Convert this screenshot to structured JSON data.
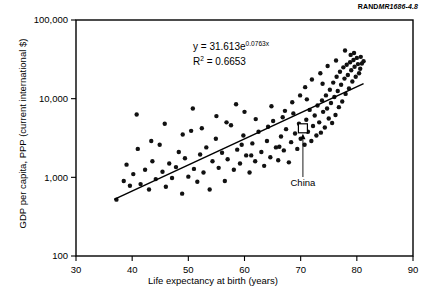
{
  "figure": {
    "source_prefix": "RAND",
    "source_id": "MR1686-4.8"
  },
  "chart_data": {
    "type": "scatter",
    "title": "",
    "xlabel": "Life expectancy at birth (years)",
    "ylabel": "GDP per capita, PPP (current international $)",
    "xlim": [
      30,
      90
    ],
    "ylim": [
      100,
      100000
    ],
    "yscale": "log",
    "xscale": "linear",
    "grid": false,
    "legend": "none",
    "xticks": [
      30,
      40,
      50,
      60,
      70,
      80,
      90
    ],
    "xtick_labels": [
      "30",
      "40",
      "50",
      "60",
      "70",
      "80",
      "90"
    ],
    "yticks": [
      100,
      1000,
      10000,
      100000
    ],
    "ytick_labels": [
      "100",
      "1,000",
      "10,000",
      "100,000"
    ],
    "annotations": [
      {
        "name": "regression-equation",
        "line1_prefix": "y = 31.613e",
        "line1_exponent": "0.0763x",
        "line2_prefix": "R",
        "line2_superscript": "2",
        "line2_suffix": " = 0.6653",
        "x": 59,
        "y": 38000
      },
      {
        "name": "china-callout",
        "label": "China",
        "point_x": 70.4,
        "point_y": 4200,
        "marker": "open-square"
      }
    ],
    "trendline": {
      "equation": "y = 31.613*exp(0.0763*x)",
      "coefficient": 31.613,
      "exponent": 0.0763,
      "r_squared": 0.6653,
      "x_start": 36.8,
      "x_end": 81.2
    },
    "points": [
      [
        37.2,
        520
      ],
      [
        38.5,
        900
      ],
      [
        39.0,
        1450
      ],
      [
        39.6,
        780
      ],
      [
        40.2,
        1100
      ],
      [
        40.8,
        6300
      ],
      [
        41.5,
        820
      ],
      [
        42.3,
        1250
      ],
      [
        43.0,
        700
      ],
      [
        43.6,
        1600
      ],
      [
        44.2,
        950
      ],
      [
        44.9,
        2600
      ],
      [
        45.4,
        1180
      ],
      [
        46.0,
        760
      ],
      [
        46.6,
        1500
      ],
      [
        47.1,
        980
      ],
      [
        47.8,
        1350
      ],
      [
        48.3,
        2100
      ],
      [
        48.9,
        620
      ],
      [
        49.4,
        1750
      ],
      [
        50.0,
        1020
      ],
      [
        50.5,
        3900
      ],
      [
        51.0,
        1280
      ],
      [
        51.6,
        880
      ],
      [
        52.1,
        1950
      ],
      [
        52.7,
        1150
      ],
      [
        53.2,
        2400
      ],
      [
        53.8,
        700
      ],
      [
        54.3,
        1600
      ],
      [
        54.9,
        3100
      ],
      [
        55.4,
        1320
      ],
      [
        56.0,
        2050
      ],
      [
        56.5,
        900
      ],
      [
        57.0,
        1700
      ],
      [
        57.6,
        4600
      ],
      [
        58.1,
        1250
      ],
      [
        58.7,
        2250
      ],
      [
        59.2,
        1500
      ],
      [
        59.8,
        3400
      ],
      [
        60.3,
        1900
      ],
      [
        60.9,
        1150
      ],
      [
        61.4,
        2700
      ],
      [
        61.9,
        1600
      ],
      [
        62.5,
        3800
      ],
      [
        63.0,
        2100
      ],
      [
        63.5,
        1400
      ],
      [
        64.0,
        2900
      ],
      [
        64.6,
        1800
      ],
      [
        65.1,
        5200
      ],
      [
        65.6,
        2400
      ],
      [
        66.0,
        1650
      ],
      [
        66.5,
        3300
      ],
      [
        67.0,
        2200
      ],
      [
        67.4,
        4100
      ],
      [
        67.9,
        1550
      ],
      [
        68.3,
        2800
      ],
      [
        68.7,
        6500
      ],
      [
        69.0,
        3600
      ],
      [
        69.4,
        2300
      ],
      [
        69.7,
        4800
      ],
      [
        70.0,
        3100
      ],
      [
        70.4,
        4200
      ],
      [
        70.7,
        2600
      ],
      [
        71.0,
        5400
      ],
      [
        71.3,
        3800
      ],
      [
        71.6,
        7200
      ],
      [
        71.9,
        2900
      ],
      [
        72.2,
        4500
      ],
      [
        72.5,
        6100
      ],
      [
        72.8,
        3400
      ],
      [
        73.0,
        8200
      ],
      [
        73.3,
        5000
      ],
      [
        73.6,
        3700
      ],
      [
        73.8,
        9500
      ],
      [
        74.0,
        6800
      ],
      [
        74.3,
        4300
      ],
      [
        74.5,
        11000
      ],
      [
        74.7,
        7500
      ],
      [
        75.0,
        5600
      ],
      [
        75.2,
        13000
      ],
      [
        75.4,
        8800
      ],
      [
        75.6,
        4900
      ],
      [
        75.8,
        16000
      ],
      [
        76.0,
        10500
      ],
      [
        76.2,
        6200
      ],
      [
        76.4,
        19000
      ],
      [
        76.6,
        12500
      ],
      [
        76.8,
        7800
      ],
      [
        77.0,
        22000
      ],
      [
        77.2,
        15000
      ],
      [
        77.4,
        9200
      ],
      [
        77.6,
        25000
      ],
      [
        77.8,
        18000
      ],
      [
        78.0,
        11500
      ],
      [
        78.2,
        27000
      ],
      [
        78.4,
        20000
      ],
      [
        78.6,
        13500
      ],
      [
        78.8,
        29000
      ],
      [
        79.0,
        23000
      ],
      [
        79.2,
        16500
      ],
      [
        79.4,
        31000
      ],
      [
        79.6,
        25500
      ],
      [
        79.8,
        19000
      ],
      [
        80.0,
        33000
      ],
      [
        80.2,
        27500
      ],
      [
        80.4,
        21000
      ],
      [
        80.6,
        24000
      ],
      [
        80.9,
        28000
      ],
      [
        81.2,
        30000
      ],
      [
        78.9,
        36000
      ],
      [
        77.9,
        41000
      ],
      [
        76.3,
        30500
      ],
      [
        74.8,
        26000
      ],
      [
        73.5,
        21000
      ],
      [
        72.0,
        17500
      ],
      [
        70.8,
        14000
      ],
      [
        69.9,
        11000
      ],
      [
        68.5,
        9000
      ],
      [
        67.2,
        7000
      ],
      [
        66.8,
        5800
      ],
      [
        64.2,
        4400
      ],
      [
        62.0,
        5500
      ],
      [
        60.0,
        6800
      ],
      [
        58.5,
        8500
      ],
      [
        56.8,
        5000
      ],
      [
        55.0,
        6000
      ],
      [
        52.4,
        4200
      ],
      [
        50.8,
        7500
      ],
      [
        49.0,
        3500
      ],
      [
        45.8,
        4800
      ],
      [
        43.4,
        2900
      ],
      [
        41.0,
        2300
      ],
      [
        79.5,
        38000
      ],
      [
        80.7,
        34000
      ],
      [
        71.1,
        9800
      ],
      [
        73.9,
        15500
      ],
      [
        64.8,
        8000
      ],
      [
        59.5,
        2600
      ],
      [
        61.2,
        1900
      ],
      [
        66.2,
        2450
      ]
    ]
  }
}
